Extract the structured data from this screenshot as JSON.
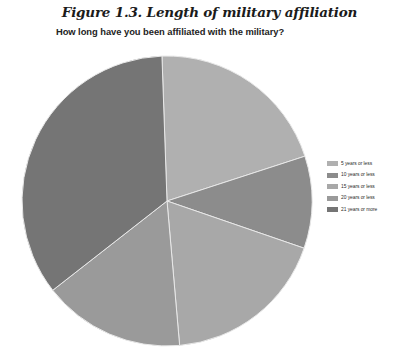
{
  "figure": {
    "title": "Figure 1.3. Length of military affiliation",
    "subtitle": "How long have you been affiliated with the military?"
  },
  "chart_data": {
    "type": "pie",
    "title": "Figure 1.3. Length of military affiliation",
    "subtitle": "How long have you been affiliated with the military?",
    "question": "How long have you been affiliated with the military?",
    "xlabel": "",
    "ylabel": "",
    "grid": false,
    "legend_position": "right",
    "start_angle_deg": 358,
    "direction": "clockwise",
    "categories": [
      "5 years or less",
      "10 years or less",
      "15 years or less",
      "20 years or less",
      "21 years or more"
    ],
    "values": [
      20.6,
      10.3,
      18.3,
      15.8,
      35.0
    ],
    "units": "percent",
    "angles_deg": [
      74,
      37,
      66,
      57,
      126
    ],
    "colors": [
      "#b0b0b0",
      "#8c8c8c",
      "#a8a8a8",
      "#9a9a9a",
      "#757575"
    ],
    "slices": [
      {
        "label": "5 years or less",
        "value": 20.6,
        "angle_deg": 74,
        "color": "#b0b0b0"
      },
      {
        "label": "10 years or less",
        "value": 10.3,
        "angle_deg": 37,
        "color": "#8c8c8c"
      },
      {
        "label": "15 years or less",
        "value": 18.3,
        "angle_deg": 66,
        "color": "#a8a8a8"
      },
      {
        "label": "20 years or less",
        "value": 15.8,
        "angle_deg": 57,
        "color": "#9a9a9a"
      },
      {
        "label": "21 years or more",
        "value": 35.0,
        "angle_deg": 126,
        "color": "#757575"
      }
    ],
    "geometry": {
      "cx": 167,
      "cy": 201,
      "r": 145
    }
  },
  "legend": {
    "items": [
      {
        "label": "5 years or less",
        "color": "#b0b0b0"
      },
      {
        "label": "10 years or less",
        "color": "#8c8c8c"
      },
      {
        "label": "15 years or less",
        "color": "#a8a8a8"
      },
      {
        "label": "20 years or less",
        "color": "#9a9a9a"
      },
      {
        "label": "21 years or more",
        "color": "#757575"
      }
    ]
  }
}
